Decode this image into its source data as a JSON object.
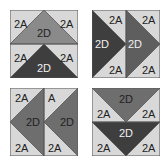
{
  "colors": {
    "light": "#d8d8d8",
    "medium": "#8a8a8a",
    "dark": "#3e3e3e",
    "stroke": "#555555",
    "text_dark": "#222222",
    "text_light": "#f0f0f0"
  },
  "blocks": [
    {
      "id": "block-1",
      "orientation": "points-up",
      "labels": {
        "tl": "2A",
        "tr": "2A",
        "top_center": "2D",
        "bl": "2A",
        "br": "2A",
        "bottom_center": "2D"
      }
    },
    {
      "id": "block-2",
      "orientation": "points-right",
      "labels": {
        "left_top": "2A",
        "left_center": "2D",
        "left_bottom": "2A",
        "right_top": "2A",
        "right_center": "2D",
        "right_bottom": "2A"
      }
    },
    {
      "id": "block-3",
      "orientation": "points-left",
      "labels": {
        "left_top": "2A",
        "left_center": "2D",
        "left_bottom": "2A",
        "right_top": "A",
        "right_center": "2D",
        "right_bottom": "2A"
      }
    },
    {
      "id": "block-4",
      "orientation": "points-down",
      "labels": {
        "top_center": "2D",
        "tl": "2A",
        "tr": "2A",
        "bottom_center": "2D",
        "bl": "2A",
        "br": "2A"
      }
    }
  ]
}
